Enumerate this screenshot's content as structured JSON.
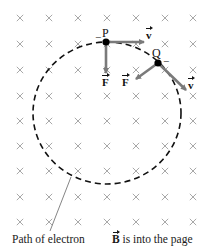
{
  "diagram": {
    "type": "physics-magnetic-field-circular-motion",
    "field_marker": "×",
    "field_marker_color": "#a8a8a8",
    "grid": {
      "columns_x": [
        20,
        49,
        78,
        107,
        136,
        165,
        193
      ],
      "rows_y": [
        18,
        44,
        70,
        96,
        121,
        146,
        171,
        197,
        222
      ]
    },
    "path": {
      "center": [
        107,
        113
      ],
      "rx": 74,
      "ry": 71,
      "style": "dashed",
      "color": "#111111"
    },
    "points": [
      {
        "label": "P",
        "position": [
          106,
          42
        ],
        "charge_sign": "−",
        "velocity": {
          "label": "v",
          "tip": [
            144,
            42
          ]
        },
        "force": {
          "label": "F",
          "tip": [
            106,
            73
          ]
        }
      },
      {
        "label": "Q",
        "position": [
          158,
          63
        ],
        "charge_sign": "−",
        "velocity": {
          "label": "v",
          "tip": [
            186,
            90
          ]
        },
        "force": {
          "label": "F",
          "tip": [
            136,
            79
          ]
        }
      }
    ],
    "arrow_color": "#7a7a7a",
    "leader_line": {
      "from": [
        71,
        177
      ],
      "to": [
        50,
        231
      ]
    }
  },
  "labels": {
    "point_p": "P",
    "point_q": "Q",
    "velocity_symbol": "v",
    "force_symbol": "F",
    "charge_minus": "−",
    "path_caption": "Path of electron",
    "field_symbol": "B",
    "field_caption_rest": " is into the page"
  }
}
